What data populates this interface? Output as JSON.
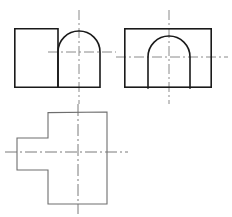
{
  "drawing": {
    "title": "Three-view orthographic projection",
    "background_color": "#ffffff",
    "outline_color": "#1a1a1a",
    "thin_outline_color": "#6e6e6e",
    "centerline_color": "#8a8a8a",
    "canvas": {
      "width": 232,
      "height": 217
    },
    "views": [
      {
        "id": "front-view",
        "name": "front-view",
        "label": "Front view - rectangle with domed right end",
        "bounds": {
          "x": 14,
          "y": 28,
          "width": 86,
          "height": 60
        },
        "outline_path": "M 14 28 L 58 28 L 58 88 L 100 88 L 100 52 A 21 21 0 0 0 58 52",
        "shapes": [
          {
            "name": "front-rect-left",
            "type": "rect",
            "x": 14,
            "y": 28,
            "width": 44,
            "height": 60
          },
          {
            "name": "front-dome-right",
            "type": "arched-block",
            "left": 58,
            "right": 100,
            "top": 31,
            "bottom": 88,
            "arc_center_x": 79,
            "arc_center_y": 52,
            "arc_radius": 21
          }
        ],
        "centerlines": [
          {
            "name": "front-horizontal-centerline",
            "orientation": "horizontal",
            "x1": 48,
            "y1": 52,
            "x2": 116,
            "y2": 52
          },
          {
            "name": "front-vertical-centerline",
            "orientation": "vertical",
            "x1": 79,
            "y1": 10,
            "x2": 79,
            "y2": 104
          }
        ]
      },
      {
        "id": "side-view",
        "name": "side-view",
        "label": "Side view - rectangle with internal arch",
        "bounds": {
          "x": 124,
          "y": 28,
          "width": 88,
          "height": 60
        },
        "shapes": [
          {
            "name": "side-outer-rect",
            "type": "rect",
            "x": 124,
            "y": 28,
            "width": 88,
            "height": 60
          },
          {
            "name": "side-inner-arch",
            "type": "arch",
            "left": 148,
            "right": 190,
            "bottom": 88,
            "arc_center_x": 169,
            "arc_center_y": 57,
            "arc_radius": 21,
            "path": "M 148 88 L 148 57 A 21 21 0 0 1 190 57 L 190 88"
          }
        ],
        "centerlines": [
          {
            "name": "side-horizontal-centerline",
            "orientation": "horizontal",
            "x1": 116,
            "y1": 57,
            "x2": 228,
            "y2": 57
          },
          {
            "name": "side-vertical-centerline",
            "orientation": "vertical",
            "x1": 169,
            "y1": 10,
            "x2": 169,
            "y2": 104
          }
        ]
      },
      {
        "id": "top-view",
        "name": "top-view",
        "label": "Top view - cross / T-shaped profile",
        "bounds": {
          "x": 17,
          "y": 112,
          "width": 90,
          "height": 92
        },
        "shapes": [
          {
            "name": "top-cross-outline",
            "type": "polygon",
            "points": "48,112 107,112 107,204 48,204 48,170 17,170 17,138 48,138"
          }
        ],
        "centerlines": [
          {
            "name": "top-horizontal-centerline",
            "orientation": "horizontal",
            "x1": 5,
            "y1": 152,
            "x2": 128,
            "y2": 152
          },
          {
            "name": "top-vertical-centerline",
            "orientation": "vertical",
            "x1": 78,
            "y1": 104,
            "x2": 78,
            "y2": 214
          }
        ]
      }
    ]
  }
}
